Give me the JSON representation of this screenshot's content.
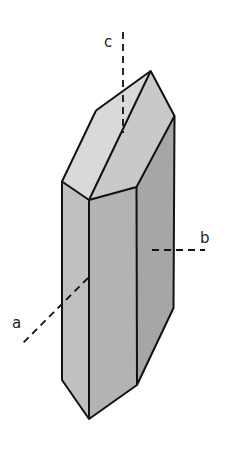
{
  "figure": {
    "colors": {
      "background": "#ffffff",
      "outline": "#111111",
      "top_left_face": "#d9d9d9",
      "top_right_face": "#c9c9c9",
      "left_face": "#c0c0c0",
      "front_face": "#b3b3b3",
      "right_face": "#a6a6a6"
    },
    "axes": [
      {
        "name": "c",
        "label": "c"
      },
      {
        "name": "b",
        "label": "b"
      },
      {
        "name": "a",
        "label": "a"
      }
    ]
  }
}
